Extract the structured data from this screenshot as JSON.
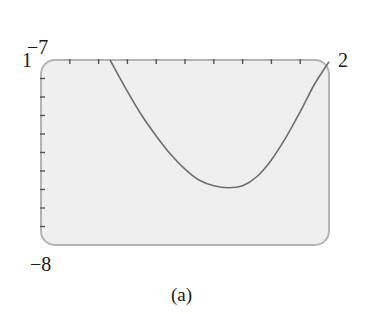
{
  "chart_data": {
    "type": "line",
    "title": "",
    "caption": "(a)",
    "xlabel": "",
    "ylabel": "",
    "xlim": [
      1,
      2
    ],
    "ylim": [
      -8,
      -7
    ],
    "window_labels": {
      "xmin": "1",
      "xmax": "2",
      "ymin": "−8",
      "ymax": "−7"
    },
    "x_ticks_count": 9,
    "y_ticks_count": 9,
    "grid": false,
    "legend": null,
    "series": [
      {
        "name": "curve",
        "x": [
          1.24,
          1.3,
          1.35,
          1.4,
          1.45,
          1.5,
          1.55,
          1.6,
          1.65,
          1.7,
          1.75,
          1.8,
          1.85,
          1.9,
          1.95,
          2.0
        ],
        "y": [
          -7.0,
          -7.17,
          -7.3,
          -7.41,
          -7.51,
          -7.59,
          -7.65,
          -7.68,
          -7.69,
          -7.68,
          -7.63,
          -7.54,
          -7.42,
          -7.28,
          -7.13,
          -7.01
        ]
      }
    ],
    "colors": {
      "frame_fill": "#efefef",
      "frame_stroke": "#b4b4b4",
      "curve": "#6e6e6e",
      "ticks": "#555555"
    }
  }
}
